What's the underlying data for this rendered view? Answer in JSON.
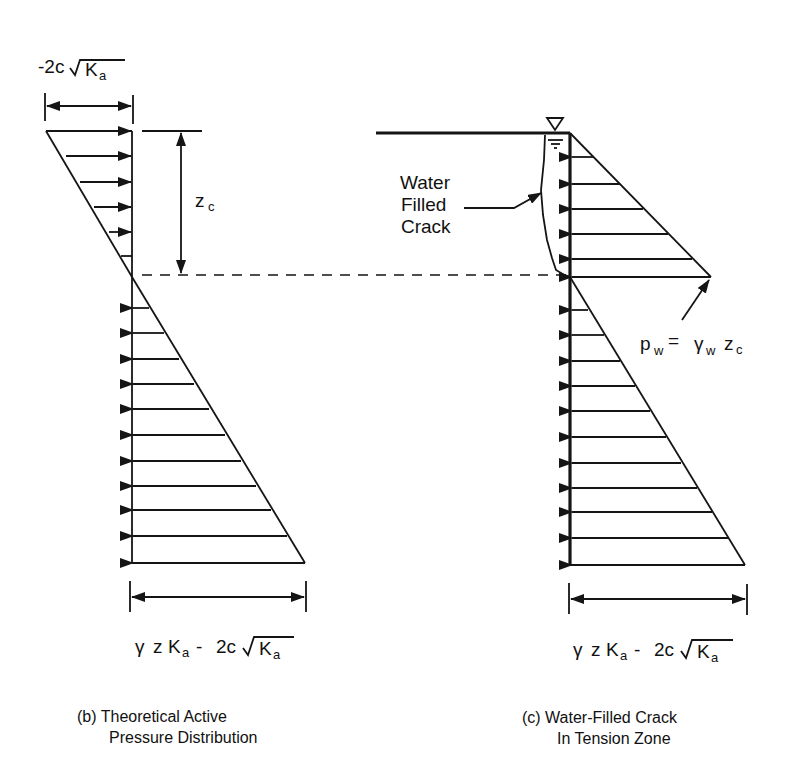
{
  "diagram": {
    "panel_b": {
      "caption_line1": "(b) Theoretical Active",
      "caption_line2": "Pressure Distribution",
      "top_dimension": {
        "prefix": "-2c",
        "radicand": "K",
        "subscript": "a"
      },
      "crack_depth_label": {
        "main": "z",
        "subscript": "c"
      },
      "bottom_dimension": {
        "gamma": "γ",
        "z": "z",
        "K": "K",
        "K_sub": "a",
        "minus": "-",
        "two_c": "2c",
        "radicand": "K",
        "radicand_sub": "a"
      },
      "tension_arrow_count": 5,
      "compression_arrow_count": 11
    },
    "panel_c": {
      "caption_line1": "(c) Water-Filled Crack",
      "caption_line2": "In Tension Zone",
      "crack_label_line1": "Water",
      "crack_label_line2": "Filled",
      "crack_label_line3": "Crack",
      "water_table_icon": "water-table-triangle-icon",
      "water_pressure_label": {
        "p": "p",
        "p_sub": "w",
        "equals": "=",
        "gamma": "γ",
        "gamma_sub": "w",
        "z": "z",
        "z_sub": "c"
      },
      "bottom_dimension": {
        "gamma": "γ",
        "z": "z",
        "K": "K",
        "K_sub": "a",
        "minus": "-",
        "two_c": "2c",
        "radicand": "K",
        "radicand_sub": "a"
      },
      "water_arrow_count": 6,
      "soil_arrow_count": 11
    }
  }
}
